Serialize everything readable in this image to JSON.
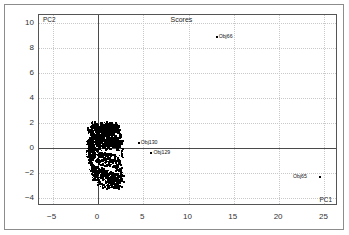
{
  "chart_data": {
    "type": "scatter",
    "title": "Scores",
    "xlabel": "PC1",
    "ylabel": "PC2",
    "xlim": [
      -6.5,
      26.5
    ],
    "ylim": [
      -4.6,
      10.6
    ],
    "xticks": [
      -5,
      0,
      5,
      10,
      15,
      20,
      25
    ],
    "yticks": [
      10,
      8,
      6,
      4,
      2,
      0,
      -2,
      -4
    ],
    "grid": true,
    "grid_style": "dotted",
    "zero_lines": true,
    "legend": null,
    "marker": "dot",
    "marker_color": "#000000",
    "annotations": [
      {
        "label": "Obj66",
        "x": 13.0,
        "y": 8.9
      },
      {
        "label": "Obj130",
        "x": 4.9,
        "y": 0.5
      },
      {
        "label": "Obj129",
        "x": 6.3,
        "y": -0.3
      },
      {
        "label": "Obj65",
        "x": 23.6,
        "y": -2.25
      }
    ],
    "cluster_description": "Dense black cluster of object scores near the origin spanning PC1 -1.2 to 2.6 and PC2 -3.1 to 1.9",
    "outliers": [
      {
        "name": "Obj66",
        "pc1": 13.0,
        "pc2": 8.9
      },
      {
        "name": "Obj130",
        "pc1": 4.4,
        "pc2": 0.5
      },
      {
        "name": "Obj129",
        "pc1": 5.8,
        "pc2": -0.3
      },
      {
        "name": "Obj65",
        "pc1": 24.4,
        "pc2": -2.25
      }
    ],
    "points": [
      [
        -1.05,
        1.35
      ],
      [
        -0.95,
        1.55
      ],
      [
        -0.85,
        1.15
      ],
      [
        -0.78,
        1.62
      ],
      [
        -0.7,
        0.95
      ],
      [
        -0.62,
        1.4
      ],
      [
        -0.55,
        1.7
      ],
      [
        -0.48,
        1.05
      ],
      [
        -0.42,
        1.5
      ],
      [
        -0.35,
        1.8
      ],
      [
        -0.3,
        0.85
      ],
      [
        -0.25,
        1.25
      ],
      [
        -0.2,
        1.65
      ],
      [
        -0.15,
        1.0
      ],
      [
        -0.1,
        1.45
      ],
      [
        -0.05,
        1.75
      ],
      [
        0.0,
        0.9
      ],
      [
        0.05,
        1.3
      ],
      [
        0.1,
        1.6
      ],
      [
        0.15,
        1.08
      ],
      [
        0.2,
        1.52
      ],
      [
        0.25,
        1.82
      ],
      [
        0.3,
        0.98
      ],
      [
        0.35,
        1.38
      ],
      [
        0.4,
        1.68
      ],
      [
        0.45,
        1.12
      ],
      [
        0.5,
        1.55
      ],
      [
        0.55,
        1.85
      ],
      [
        0.6,
        1.02
      ],
      [
        0.65,
        1.42
      ],
      [
        0.7,
        1.72
      ],
      [
        0.75,
        1.18
      ],
      [
        0.8,
        1.58
      ],
      [
        0.85,
        1.88
      ],
      [
        0.9,
        1.06
      ],
      [
        0.95,
        1.46
      ],
      [
        1.0,
        1.76
      ],
      [
        1.05,
        1.22
      ],
      [
        1.1,
        1.62
      ],
      [
        1.15,
        1.9
      ],
      [
        1.2,
        1.1
      ],
      [
        1.25,
        1.5
      ],
      [
        1.3,
        1.8
      ],
      [
        1.35,
        1.26
      ],
      [
        1.4,
        1.66
      ],
      [
        1.45,
        1.15
      ],
      [
        1.5,
        1.55
      ],
      [
        1.55,
        1.84
      ],
      [
        1.6,
        1.3
      ],
      [
        1.65,
        1.7
      ],
      [
        1.7,
        1.2
      ],
      [
        1.75,
        1.6
      ],
      [
        1.8,
        1.05
      ],
      [
        1.85,
        1.45
      ],
      [
        1.9,
        1.35
      ],
      [
        -1.1,
        0.75
      ],
      [
        -1.0,
        0.55
      ],
      [
        -0.9,
        0.35
      ],
      [
        -0.82,
        0.68
      ],
      [
        -0.74,
        0.18
      ],
      [
        -0.66,
        0.48
      ],
      [
        -0.58,
        0.78
      ],
      [
        -0.5,
        0.28
      ],
      [
        -0.44,
        0.58
      ],
      [
        -0.38,
        0.08
      ],
      [
        -0.32,
        0.38
      ],
      [
        -0.26,
        0.68
      ],
      [
        -0.2,
        0.22
      ],
      [
        -0.14,
        0.52
      ],
      [
        -0.08,
        0.82
      ],
      [
        -0.02,
        0.32
      ],
      [
        0.04,
        0.62
      ],
      [
        0.1,
        0.12
      ],
      [
        0.16,
        0.42
      ],
      [
        0.22,
        0.72
      ],
      [
        0.28,
        0.25
      ],
      [
        0.34,
        0.55
      ],
      [
        0.4,
        0.85
      ],
      [
        0.46,
        0.35
      ],
      [
        0.52,
        0.65
      ],
      [
        0.58,
        0.15
      ],
      [
        0.64,
        0.45
      ],
      [
        0.7,
        0.75
      ],
      [
        0.76,
        0.28
      ],
      [
        0.82,
        0.58
      ],
      [
        0.88,
        0.88
      ],
      [
        0.94,
        0.38
      ],
      [
        1.0,
        0.68
      ],
      [
        1.06,
        0.18
      ],
      [
        1.12,
        0.48
      ],
      [
        1.18,
        0.78
      ],
      [
        1.24,
        0.3
      ],
      [
        1.3,
        0.6
      ],
      [
        1.36,
        0.9
      ],
      [
        1.42,
        0.4
      ],
      [
        1.48,
        0.7
      ],
      [
        1.54,
        0.2
      ],
      [
        1.6,
        0.5
      ],
      [
        1.66,
        0.8
      ],
      [
        1.72,
        0.32
      ],
      [
        1.78,
        0.62
      ],
      [
        1.84,
        0.14
      ],
      [
        1.9,
        0.44
      ],
      [
        1.96,
        0.74
      ],
      [
        2.02,
        0.26
      ],
      [
        2.08,
        0.56
      ],
      [
        2.14,
        0.1
      ],
      [
        2.2,
        0.4
      ],
      [
        2.26,
        0.66
      ],
      [
        2.32,
        0.22
      ],
      [
        -1.15,
        -0.15
      ],
      [
        -1.05,
        -0.45
      ],
      [
        -0.95,
        -0.75
      ],
      [
        -0.85,
        -0.25
      ],
      [
        -0.75,
        -0.55
      ],
      [
        -0.65,
        -0.85
      ],
      [
        -0.55,
        -0.35
      ],
      [
        -0.45,
        -0.65
      ],
      [
        -0.35,
        -0.95
      ],
      [
        -0.25,
        -0.18
      ],
      [
        -0.15,
        -0.48
      ],
      [
        -0.05,
        -0.78
      ],
      [
        0.05,
        -1.08
      ],
      [
        0.15,
        -0.28
      ],
      [
        0.25,
        -0.58
      ],
      [
        0.35,
        -0.88
      ],
      [
        0.45,
        -1.18
      ],
      [
        0.55,
        -0.38
      ],
      [
        0.65,
        -0.68
      ],
      [
        0.75,
        -0.98
      ],
      [
        0.85,
        -1.28
      ],
      [
        0.95,
        -0.42
      ],
      [
        1.05,
        -0.72
      ],
      [
        1.15,
        -1.02
      ],
      [
        1.25,
        -1.32
      ],
      [
        1.35,
        -0.52
      ],
      [
        1.45,
        -0.82
      ],
      [
        1.55,
        -1.12
      ],
      [
        1.65,
        -1.42
      ],
      [
        1.75,
        -0.62
      ],
      [
        1.85,
        -0.92
      ],
      [
        1.95,
        -1.22
      ],
      [
        2.05,
        -1.52
      ],
      [
        2.15,
        -0.85
      ],
      [
        2.25,
        -1.15
      ],
      [
        -0.6,
        -1.35
      ],
      [
        -0.5,
        -1.65
      ],
      [
        -0.4,
        -1.95
      ],
      [
        -0.3,
        -1.45
      ],
      [
        -0.2,
        -1.75
      ],
      [
        -0.1,
        -2.05
      ],
      [
        0.0,
        -1.55
      ],
      [
        0.1,
        -1.85
      ],
      [
        0.2,
        -2.15
      ],
      [
        0.3,
        -1.65
      ],
      [
        0.4,
        -1.95
      ],
      [
        0.5,
        -2.25
      ],
      [
        0.6,
        -1.72
      ],
      [
        0.7,
        -2.02
      ],
      [
        0.8,
        -2.32
      ],
      [
        0.9,
        -1.8
      ],
      [
        1.0,
        -2.1
      ],
      [
        1.1,
        -2.4
      ],
      [
        1.2,
        -1.88
      ],
      [
        1.3,
        -2.18
      ],
      [
        1.4,
        -2.48
      ],
      [
        1.5,
        -1.95
      ],
      [
        1.6,
        -2.25
      ],
      [
        1.7,
        -2.55
      ],
      [
        1.8,
        -2.02
      ],
      [
        1.9,
        -2.32
      ],
      [
        2.0,
        -2.62
      ],
      [
        2.1,
        -2.12
      ],
      [
        2.2,
        -2.42
      ],
      [
        2.3,
        -2.7
      ],
      [
        2.4,
        -2.22
      ],
      [
        2.5,
        -2.52
      ],
      [
        2.55,
        -2.05
      ],
      [
        2.45,
        -1.85
      ],
      [
        2.35,
        -1.6
      ],
      [
        0.15,
        -2.65
      ],
      [
        0.35,
        -2.78
      ],
      [
        0.55,
        -2.88
      ],
      [
        0.75,
        -2.72
      ],
      [
        0.95,
        -2.95
      ],
      [
        1.15,
        -2.68
      ],
      [
        1.35,
        -2.85
      ],
      [
        1.55,
        -2.98
      ],
      [
        1.75,
        -2.75
      ],
      [
        1.95,
        -2.9
      ],
      [
        2.15,
        -3.02
      ],
      [
        2.35,
        -2.95
      ],
      [
        0.45,
        -3.05
      ],
      [
        1.05,
        -3.1
      ],
      [
        1.65,
        -3.05
      ],
      [
        -0.88,
        -1.25
      ],
      [
        -0.78,
        -1.55
      ],
      [
        -0.68,
        -1.85
      ],
      [
        -0.58,
        -2.15
      ],
      [
        -0.48,
        -2.45
      ],
      [
        -0.38,
        -1.38
      ],
      [
        -0.28,
        -1.68
      ],
      [
        -0.18,
        -1.98
      ],
      [
        -0.08,
        -2.28
      ],
      [
        0.02,
        -2.58
      ],
      [
        -0.7,
        -0.05
      ],
      [
        -0.8,
        0.1
      ],
      [
        -0.9,
        -0.08
      ],
      [
        -1.0,
        0.05
      ],
      [
        -1.08,
        0.25
      ],
      [
        -1.18,
        0.45
      ],
      [
        -1.12,
        -0.3
      ],
      [
        -1.02,
        -0.62
      ],
      [
        -0.92,
        -0.92
      ],
      [
        -0.82,
        -1.1
      ],
      [
        2.42,
        0.95
      ],
      [
        2.48,
        0.62
      ],
      [
        2.38,
        0.3
      ],
      [
        2.52,
        -0.15
      ],
      [
        2.58,
        -0.55
      ],
      [
        2.28,
        1.15
      ],
      [
        2.18,
        1.42
      ],
      [
        2.08,
        1.62
      ],
      [
        1.98,
        1.8
      ],
      [
        1.88,
        1.92
      ],
      [
        -0.62,
        1.95
      ],
      [
        -0.42,
        1.98
      ],
      [
        -0.22,
        2.02
      ],
      [
        0.18,
        1.96
      ],
      [
        0.58,
        1.94
      ],
      [
        0.98,
        1.98
      ],
      [
        1.38,
        1.95
      ],
      [
        1.58,
        1.9
      ],
      [
        0.78,
        2.0
      ],
      [
        0.38,
        1.92
      ]
    ]
  },
  "frame": {
    "outer_border_color": "#8c8c8c",
    "plot_border_color": "#555555",
    "grid_color": "#c9c9c9",
    "zero_line_color": "#4a4a4a",
    "background": "#ffffff"
  }
}
